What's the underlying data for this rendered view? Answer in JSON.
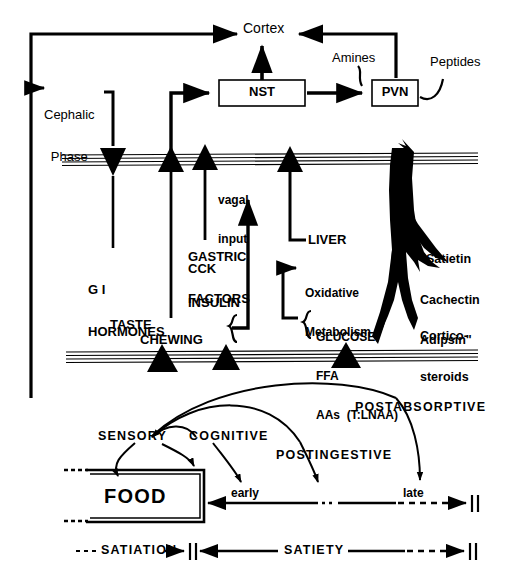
{
  "figure": {
    "ink_color": "#000000",
    "background_color": "#ffffff"
  },
  "brain": {
    "cortex_label": "Cortex",
    "nst_label": "NST",
    "pvn_label": "PVN",
    "amines_label": "Amines",
    "peptides_label": "Peptides"
  },
  "periphery": {
    "cephalic_phase_line1": "Cephalic",
    "cephalic_phase_line2": "Phase",
    "gi_hormones_line1": "G I",
    "gi_hormones_line2": "HORMONES",
    "taste_label": "TASTE",
    "chewing_label": "CHEWING",
    "gastric_factors_line1": "GASTRIC",
    "gastric_factors_line2": "FACTORS",
    "cck_label": "CCK",
    "insulin_label": "INSULIN",
    "vagal_input_line1": "vagal",
    "vagal_input_line2": "input",
    "liver_label": "LIVER",
    "oxidative_line1": "Oxidative",
    "oxidative_line2": "Metabolism",
    "glucose_label": "GLUCOSE",
    "ffa_label": "FFA",
    "aas_label": "AAs  (T:LNAA)",
    "satietin_line1": "\"Satietin",
    "satietin_line2": "Cachectin",
    "satietin_line3": "Adipsin\"",
    "cortico_line1": "Cortico-",
    "cortico_line2": "steroids"
  },
  "behaviour": {
    "food_label": "FOOD",
    "sensory_label": "SENSORY",
    "cognitive_label": "COGNITIVE",
    "postingestive_label": "POSTINGESTIVE",
    "postabsorptive_label": "POSTABSORPTIVE",
    "early_label": "early",
    "late_label": "late",
    "satiation_label": "SATIATION",
    "satiety_label": "SATIETY"
  }
}
